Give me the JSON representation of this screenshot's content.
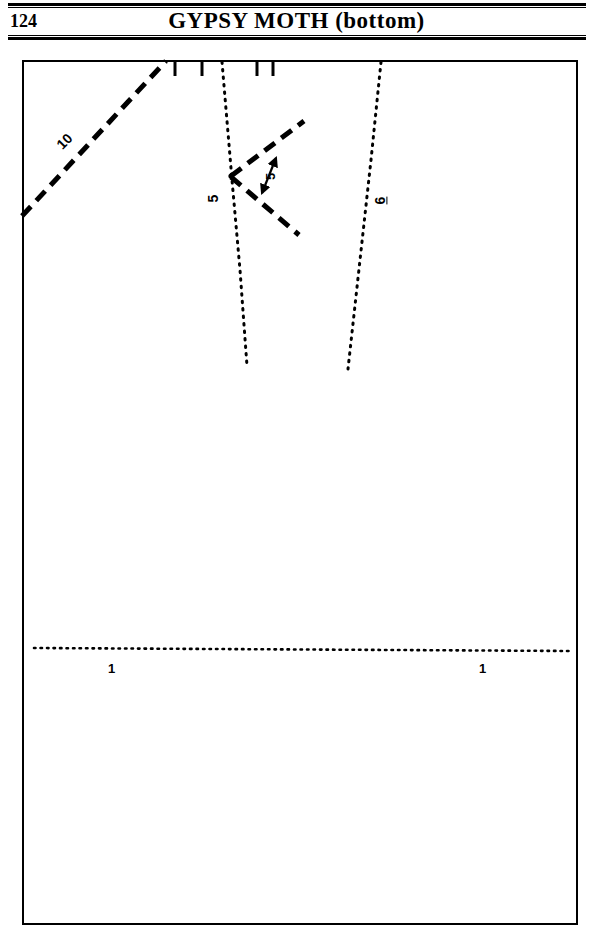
{
  "header": {
    "page_number": "124",
    "title": "GYPSY MOTH (bottom)"
  },
  "pattern": {
    "name": "gypsy-moth-bottom-pattern-piece",
    "ink_color": "#000000",
    "background_color": "#ffffff",
    "labels": {
      "seam_allowance_10": "10",
      "fold_line_5": "5",
      "dart_width_5": "5",
      "placement_line_6": "6",
      "grain_one_left": "1",
      "grain_one_right": "1"
    },
    "notches": {
      "count": 4,
      "positions_px": [
        175,
        202,
        257,
        273
      ]
    },
    "lines": [
      {
        "name": "corner-dashed-diagonal",
        "style": "dashed",
        "label": "10"
      },
      {
        "name": "left-dotted-fold-line",
        "style": "dotted",
        "label": "5"
      },
      {
        "name": "right-dotted-placement-line",
        "style": "dotted",
        "label": "6"
      },
      {
        "name": "dart-upper-arm",
        "style": "dashed",
        "label": ""
      },
      {
        "name": "dart-lower-arm",
        "style": "dashed",
        "label": ""
      },
      {
        "name": "dart-width-arrow",
        "style": "solid-double-arrow",
        "label": "5"
      },
      {
        "name": "horizontal-dotted-hemline",
        "style": "dotted",
        "label": "1"
      }
    ]
  }
}
